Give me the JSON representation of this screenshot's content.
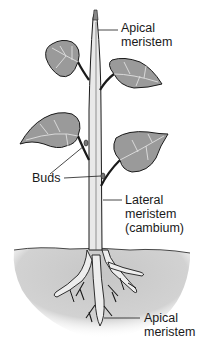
{
  "diagram": {
    "labels": {
      "apical_top_line1": "Apical",
      "apical_top_line2": "meristem",
      "buds": "Buds",
      "lateral_line1": "Lateral",
      "lateral_line2": "meristem",
      "lateral_line3": "(cambium)",
      "apical_bottom_line1": "Apical",
      "apical_bottom_line2": "meristem"
    },
    "colors": {
      "line": "#1a1a1a",
      "leaf_fill": "#9a9a9a",
      "leaf_light": "#c4c4c4",
      "stem_fill": "#e6e6e6",
      "soil": "#cfcfcf"
    }
  }
}
